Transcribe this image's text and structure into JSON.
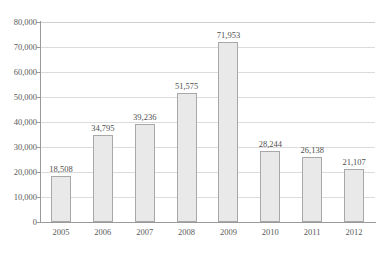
{
  "chart_data": {
    "type": "bar",
    "title": "図1　［タイトル一部欠損］（2005〜2012）",
    "xlabel": "",
    "ylabel": "",
    "categories": [
      "2005",
      "2006",
      "2007",
      "2008",
      "2009",
      "2010",
      "2011",
      "2012"
    ],
    "values": [
      18508,
      34795,
      39236,
      51575,
      71953,
      28244,
      26138,
      21107
    ],
    "value_labels": [
      "18,508",
      "34,795",
      "39,236",
      "51,575",
      "71,953",
      "28,244",
      "26,138",
      "21,107"
    ],
    "ylim": [
      0,
      80000
    ],
    "ytick_values": [
      80000,
      70000,
      60000,
      50000,
      40000,
      30000,
      20000,
      10000,
      0
    ],
    "ytick_labels": [
      "80,000",
      "70,000",
      "60,000",
      "50,000",
      "40,000",
      "30,000",
      "20,000",
      "10,000",
      "0"
    ],
    "grid": "horizontal",
    "legend": "none",
    "bar_fill_color": "#e9e9e9",
    "bar_border_color": "#a8a8a8",
    "gridline_color": "#dcdcdc",
    "axis_color": "#9a9a9a",
    "background_color": "#ffffff",
    "text_color": "#4f4f4f"
  }
}
